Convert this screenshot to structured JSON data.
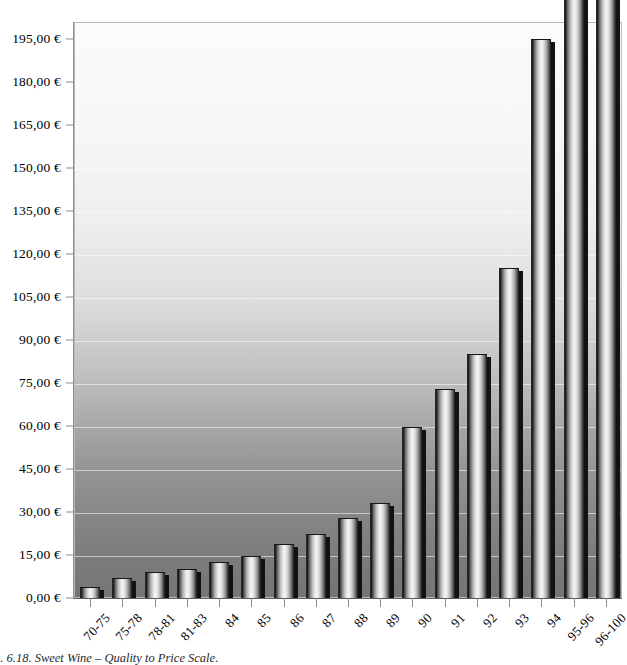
{
  "caption": "g. 6.18. Sweet Wine – Quality to Price Scale.",
  "axis": {
    "y_tick_labels": [
      "0,00 €",
      "15,00 €",
      "30,00 €",
      "45,00 €",
      "60,00 €",
      "75,00 €",
      "90,00 €",
      "105,00 €",
      "120,00 €",
      "135,00 €",
      "150,00 €",
      "165,00 €",
      "180,00 €",
      "195,00 €"
    ]
  },
  "chart_data": {
    "type": "bar",
    "title": "g. 6.18. Sweet Wine – Quality to Price Scale.",
    "xlabel": "",
    "ylabel": "",
    "currency": "EUR",
    "number_format": "de-DE",
    "grid": true,
    "legend": "none",
    "ylim": [
      0,
      195
    ],
    "ytick_step": 15,
    "yticks": [
      0,
      15,
      30,
      45,
      60,
      75,
      90,
      105,
      120,
      135,
      150,
      165,
      180,
      195
    ],
    "ytick_labels": [
      "0,00 €",
      "15,00 €",
      "30,00 €",
      "45,00 €",
      "60,00 €",
      "75,00 €",
      "90,00 €",
      "105,00 €",
      "120,00 €",
      "135,00 €",
      "150,00 €",
      "165,00 €",
      "180,00 €",
      "195,00 €"
    ],
    "categories": [
      "70-75",
      "75-78",
      "78-81",
      "81-83",
      "84",
      "85",
      "86",
      "87",
      "88",
      "89",
      "90",
      "91",
      "92",
      "93",
      "94",
      "95-96",
      "96-100"
    ],
    "values": [
      4.0,
      7.0,
      9.0,
      10.0,
      12.5,
      14.5,
      19.0,
      22.5,
      28.0,
      33.0,
      59.5,
      73.0,
      85.0,
      115.0,
      195.0,
      222.0,
      220.0
    ]
  }
}
